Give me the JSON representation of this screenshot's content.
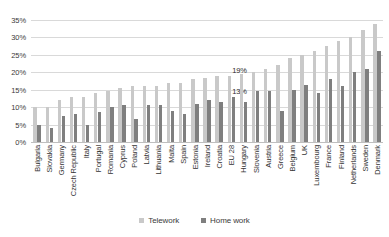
{
  "chart_data": {
    "type": "bar",
    "title": "",
    "subtitle": "",
    "xlabel": "",
    "ylabel": "",
    "ylim": [
      0,
      35
    ],
    "y_ticks": [
      "0%",
      "5%",
      "10%",
      "15%",
      "20%",
      "25%",
      "30%",
      "35%"
    ],
    "y_tick_values": [
      0,
      5,
      10,
      15,
      20,
      25,
      30,
      35
    ],
    "grid": true,
    "legend_position": "bottom",
    "categories": [
      "Bulgaria",
      "Slovakia",
      "Germany",
      "Czech Republic",
      "Italy",
      "Portugal",
      "Romania",
      "Cyprus",
      "Poland",
      "Latvia",
      "Lithuania",
      "Malta",
      "Spain",
      "Estonia",
      "Ireland",
      "Croatia",
      "EU 28",
      "Hungary",
      "Slovenia",
      "Austria",
      "Greece",
      "Belgium",
      "UK",
      "Luxembourg",
      "France",
      "Finland",
      "Netherlands",
      "Sweden",
      "Denmark"
    ],
    "series": [
      {
        "name": "Telework",
        "color": "#c9c9c9",
        "values": [
          10,
          10,
          12,
          13,
          13,
          14,
          14.5,
          15.5,
          16,
          16,
          16,
          17,
          17,
          18,
          18.5,
          19,
          19,
          19.5,
          20,
          21,
          22,
          24,
          25,
          26,
          27.5,
          29,
          30,
          32,
          34
        ]
      },
      {
        "name": "Home work",
        "color": "#7f7f7f",
        "values": [
          5,
          4,
          7.5,
          8,
          5,
          8.5,
          10,
          10.5,
          6.5,
          10.5,
          10.5,
          9,
          8,
          11,
          12,
          11.5,
          13,
          11.5,
          14.5,
          14.5,
          9,
          15,
          16.5,
          14,
          18,
          16,
          20,
          21,
          26
        ]
      }
    ],
    "annotations": [
      {
        "text": "19%",
        "category": "EU 28",
        "series": "Telework"
      },
      {
        "text": "13%",
        "category": "EU 28",
        "series": "Home work"
      }
    ]
  },
  "legend": {
    "items": [
      {
        "label": "Telework",
        "swatch": "telework-swatch"
      },
      {
        "label": "Home work",
        "swatch": "homework-swatch"
      }
    ]
  }
}
